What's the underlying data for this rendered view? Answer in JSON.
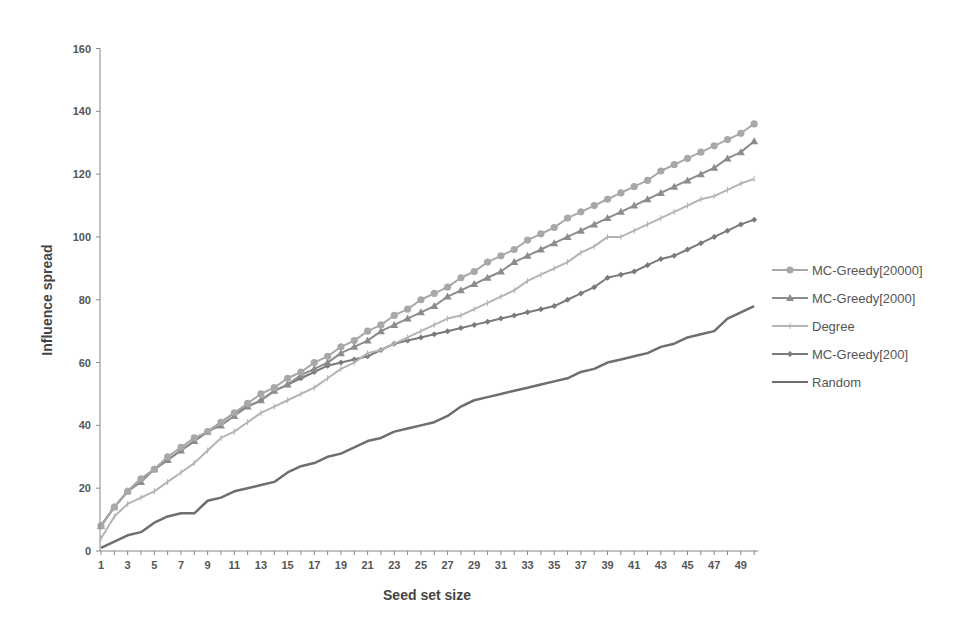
{
  "chart_data": {
    "type": "line",
    "title": "",
    "xlabel": "Seed set size",
    "ylabel": "Influence spread",
    "xlim": [
      1,
      50
    ],
    "ylim": [
      0,
      160
    ],
    "y_ticks": [
      0,
      20,
      40,
      60,
      80,
      100,
      120,
      140,
      160
    ],
    "x_tick_labels": [
      "1",
      "3",
      "5",
      "7",
      "9",
      "11",
      "13",
      "15",
      "17",
      "19",
      "21",
      "23",
      "25",
      "27",
      "29",
      "31",
      "33",
      "35",
      "37",
      "39",
      "41",
      "43",
      "45",
      "47",
      "49"
    ],
    "grid": false,
    "legend_position": "right",
    "x": [
      1,
      2,
      3,
      4,
      5,
      6,
      7,
      8,
      9,
      10,
      11,
      12,
      13,
      14,
      15,
      16,
      17,
      18,
      19,
      20,
      21,
      22,
      23,
      24,
      25,
      26,
      27,
      28,
      29,
      30,
      31,
      32,
      33,
      34,
      35,
      36,
      37,
      38,
      39,
      40,
      41,
      42,
      43,
      44,
      45,
      46,
      47,
      48,
      49,
      50
    ],
    "series": [
      {
        "name": "MC-Greedy[20000]",
        "marker": "circle",
        "color": "#a8a8a8",
        "values": [
          8,
          14,
          19,
          23,
          26,
          30,
          33,
          36,
          38,
          41,
          44,
          47,
          50,
          52,
          55,
          57,
          60,
          62,
          65,
          67,
          70,
          72,
          75,
          77,
          80,
          82,
          84,
          87,
          89,
          92,
          94,
          96,
          99,
          101,
          103,
          106,
          108,
          110,
          112,
          114,
          116,
          118,
          121,
          123,
          125,
          127,
          129,
          131,
          133,
          136
        ]
      },
      {
        "name": "MC-Greedy[2000]",
        "marker": "triangle",
        "color": "#8c8c8c",
        "values": [
          8,
          14,
          19,
          22,
          26,
          29,
          32,
          35,
          38,
          40,
          43,
          46,
          48,
          51,
          53,
          56,
          58,
          60,
          63,
          65,
          67,
          70,
          72,
          74,
          76,
          78,
          81,
          83,
          85,
          87,
          89,
          92,
          94,
          96,
          98,
          100,
          102,
          104,
          106,
          108,
          110,
          112,
          114,
          116,
          118,
          120,
          122,
          125,
          127,
          130.5
        ]
      },
      {
        "name": "Degree",
        "marker": "dash",
        "color": "#b4b4b4",
        "values": [
          4,
          11,
          15,
          17,
          19,
          22,
          25,
          28,
          32,
          36,
          38,
          41,
          44,
          46,
          48,
          50,
          52,
          55,
          58,
          60,
          63,
          64,
          66,
          68,
          70,
          72,
          74,
          75,
          77,
          79,
          81,
          83,
          86,
          88,
          90,
          92,
          95,
          97,
          100,
          100,
          102,
          104,
          106,
          108,
          110,
          112,
          113,
          115,
          117,
          118.5
        ]
      },
      {
        "name": "MC-Greedy[200]",
        "marker": "diamond",
        "color": "#7a7a7a",
        "values": [
          8,
          14,
          19,
          23,
          26,
          29,
          32,
          35,
          38,
          41,
          44,
          46,
          48,
          51,
          53,
          55,
          57,
          59,
          60,
          61,
          62,
          64,
          66,
          67,
          68,
          69,
          70,
          71,
          72,
          73,
          74,
          75,
          76,
          77,
          78,
          80,
          82,
          84,
          87,
          88,
          89,
          91,
          93,
          94,
          96,
          98,
          100,
          102,
          104,
          105.5
        ]
      },
      {
        "name": "Random",
        "marker": "none",
        "color": "#6e6e6e",
        "values": [
          1,
          3,
          5,
          6,
          9,
          11,
          12,
          12,
          16,
          17,
          19,
          20,
          21,
          22,
          25,
          27,
          28,
          30,
          31,
          33,
          35,
          36,
          38,
          39,
          40,
          41,
          43,
          46,
          48,
          49,
          50,
          51,
          52,
          53,
          54,
          55,
          57,
          58,
          60,
          61,
          62,
          63,
          65,
          66,
          68,
          69,
          70,
          74,
          76,
          78
        ]
      }
    ]
  }
}
